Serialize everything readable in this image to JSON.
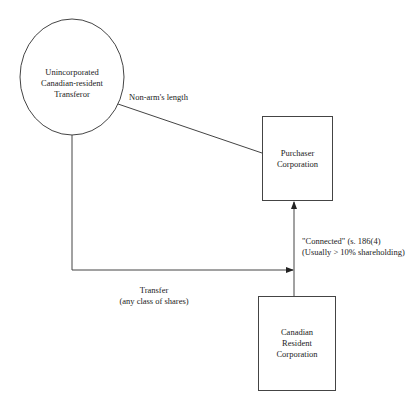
{
  "diagram": {
    "nodes": {
      "transferor": {
        "shape": "ellipse",
        "lines": [
          "Unincorporated",
          "Canadian-resident",
          "Transferor"
        ]
      },
      "purchaser": {
        "shape": "rectangle",
        "lines": [
          "Purchaser",
          "Corporation"
        ]
      },
      "resident_corp": {
        "shape": "rectangle",
        "lines": [
          "Canadian",
          "Resident",
          "Corporation"
        ]
      }
    },
    "edges": {
      "non_arms_length": {
        "from": "transferor",
        "to": "purchaser",
        "label": "Non-arm's length",
        "arrow": false
      },
      "transfer": {
        "from": "transferor",
        "to": "resident_corp",
        "label_lines": [
          "Transfer",
          "(any class of shares)"
        ],
        "arrow": true
      },
      "connected": {
        "from": "resident_corp",
        "to": "purchaser",
        "label_lines": [
          "\"Connected\" (s. 186(4)",
          "(Usually > 10% shareholding)"
        ],
        "arrow": true
      }
    }
  }
}
